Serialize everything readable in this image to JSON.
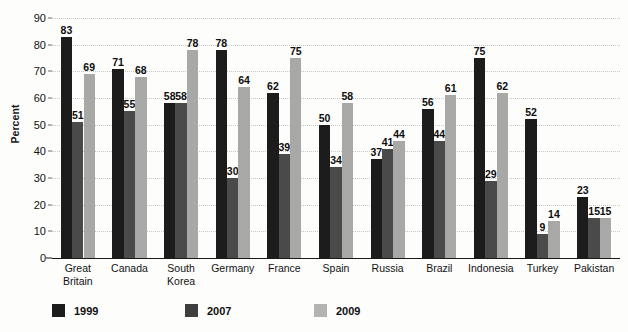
{
  "chart_data": {
    "type": "bar",
    "title": "",
    "subtitle": "",
    "xlabel": "",
    "ylabel": "Percent",
    "ylim": [
      0,
      90
    ],
    "ytick_step": 10,
    "yticks": [
      0,
      10,
      20,
      30,
      40,
      50,
      60,
      70,
      80,
      90
    ],
    "grid": true,
    "legend_position": "bottom-left",
    "categories": [
      "Great\nBritain",
      "Canada",
      "South\nKorea",
      "Germany",
      "France",
      "Spain",
      "Russia",
      "Brazil",
      "Indonesia",
      "Turkey",
      "Pakistan"
    ],
    "series": [
      {
        "name": "1999",
        "color": "#1c1c1c",
        "values": [
          83,
          71,
          58,
          78,
          62,
          50,
          37,
          56,
          75,
          52,
          23
        ]
      },
      {
        "name": "2007",
        "color": "#4a4a4a",
        "values": [
          51,
          55,
          58,
          30,
          39,
          34,
          41,
          44,
          29,
          9,
          15
        ]
      },
      {
        "name": "2009",
        "color": "#a8a8a6",
        "values": [
          69,
          68,
          78,
          64,
          75,
          58,
          44,
          61,
          62,
          14,
          15
        ]
      }
    ]
  },
  "colors": {
    "series_1999": "#1c1c1c",
    "series_2007": "#4a4a4a",
    "series_2009": "#a8a8a6",
    "gridline": "#c8c8c4",
    "axis": "#1a1a1a",
    "background": "#fdfdfc"
  }
}
